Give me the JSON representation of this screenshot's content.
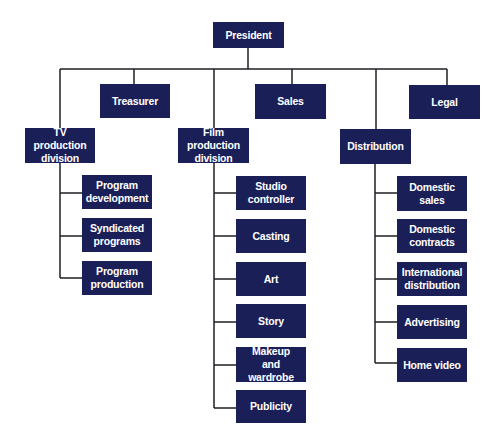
{
  "colors": {
    "box": "#1b1f58",
    "text": "#ffffff",
    "line": "#1e1e24"
  },
  "chart": {
    "type": "org-chart",
    "root": {
      "id": "president",
      "label": "President",
      "box": [
        213,
        22,
        71,
        26
      ]
    },
    "top_level": [
      {
        "id": "treasurer",
        "label": "Treasurer",
        "box": [
          100,
          84,
          70,
          34
        ]
      },
      {
        "id": "sales",
        "label": "Sales",
        "box": [
          255,
          84,
          71,
          35
        ]
      },
      {
        "id": "legal",
        "label": "Legal",
        "box": [
          409,
          85,
          71,
          34
        ]
      },
      {
        "id": "tv-production-division",
        "label": "TV production\ndivision",
        "box": [
          25,
          128,
          70,
          35
        ]
      },
      {
        "id": "film-production-division",
        "label": "Film production\ndivision",
        "box": [
          178,
          128,
          71,
          35
        ]
      },
      {
        "id": "distribution",
        "label": "Distribution",
        "box": [
          340,
          129,
          71,
          35
        ]
      }
    ],
    "subunits": {
      "tv-production-division": [
        {
          "label": "Program\ndevelopment",
          "box": [
            82,
            175,
            70,
            34
          ]
        },
        {
          "label": "Syndicated\nprograms",
          "box": [
            82,
            218,
            70,
            34
          ]
        },
        {
          "label": "Program\nproduction",
          "box": [
            82,
            261,
            70,
            34
          ]
        }
      ],
      "film-production-division": [
        {
          "label": "Studio\ncontroller",
          "box": [
            236,
            176,
            70,
            34
          ]
        },
        {
          "label": "Casting",
          "box": [
            236,
            219,
            70,
            34
          ]
        },
        {
          "label": "Art",
          "box": [
            236,
            262,
            70,
            34
          ]
        },
        {
          "label": "Story",
          "box": [
            236,
            304,
            70,
            34
          ]
        },
        {
          "label": "Makeup\nand wardrobe",
          "box": [
            236,
            347,
            70,
            35
          ]
        },
        {
          "label": "Publicity",
          "box": [
            236,
            390,
            70,
            33
          ]
        }
      ],
      "distribution": [
        {
          "label": "Domestic\nsales",
          "box": [
            397,
            176,
            70,
            35
          ]
        },
        {
          "label": "Domestic\ncontracts",
          "box": [
            397,
            219,
            70,
            34
          ]
        },
        {
          "label": "International\ndistribution",
          "box": [
            397,
            262,
            70,
            34
          ]
        },
        {
          "label": "Advertising",
          "box": [
            397,
            305,
            70,
            34
          ]
        },
        {
          "label": "Home video",
          "box": [
            397,
            348,
            70,
            34
          ]
        }
      ]
    }
  }
}
